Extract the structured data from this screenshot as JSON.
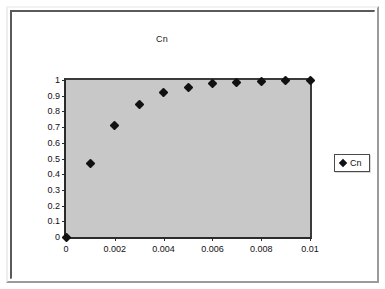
{
  "chart_data": {
    "type": "scatter",
    "title": "Cn",
    "xlabel": "",
    "ylabel": "",
    "xlim": [
      0,
      0.01
    ],
    "ylim": [
      0,
      1
    ],
    "grid": false,
    "legend_position": "right",
    "plot_background": "#c8c8c8",
    "marker_color": "#111111",
    "marker_shape": "diamond",
    "xticks": [
      0,
      0.002,
      0.004,
      0.006,
      0.008,
      0.01
    ],
    "xtick_labels": [
      "0",
      "0.002",
      "0.004",
      "0.006",
      "0.008",
      "0.01"
    ],
    "yticks": [
      0,
      0.1,
      0.2,
      0.3,
      0.4,
      0.5,
      0.6,
      0.7,
      0.8,
      0.9,
      1
    ],
    "ytick_labels": [
      "0",
      "0.1",
      "0.2",
      "0.3",
      "0.4",
      "0.5",
      "0.6",
      "0.7",
      "0.8",
      "0.9",
      "1"
    ],
    "series": [
      {
        "name": "Cn",
        "x": [
          0,
          0.001,
          0.002,
          0.003,
          0.004,
          0.005,
          0.006,
          0.007,
          0.008,
          0.009,
          0.01
        ],
        "values": [
          0,
          0.465,
          0.71,
          0.845,
          0.92,
          0.955,
          0.975,
          0.987,
          0.993,
          0.996,
          1.0
        ]
      }
    ]
  },
  "legend": {
    "entries": [
      {
        "label": "Cn",
        "marker": "diamond-marker"
      }
    ]
  }
}
